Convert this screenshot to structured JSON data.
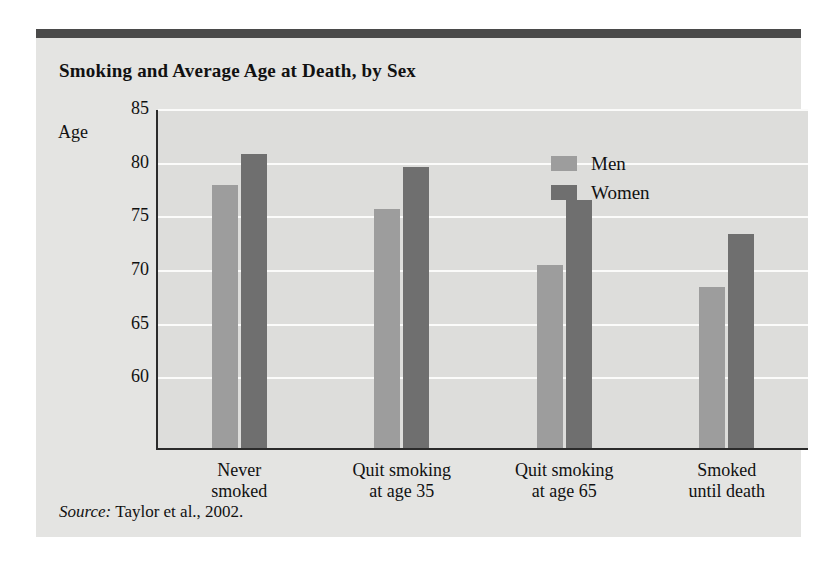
{
  "figure": {
    "title": "Smoking and Average Age at Death, by Sex",
    "axis_label": "Age",
    "source_prefix": "Source:",
    "source_text": " Taylor et al., 2002."
  },
  "colors": {
    "men": "#9d9d9d",
    "women": "#6f6f6f",
    "plot_background": "#dddddb",
    "figure_background": "#e4e4e2",
    "band": "#4a4a4a",
    "axis": "#2b2b2b",
    "gridline": "#fbfbfa"
  },
  "legend": {
    "position": "top-right",
    "entries": [
      {
        "label": "Men",
        "color": "#9d9d9d"
      },
      {
        "label": "Women",
        "color": "#6f6f6f"
      }
    ]
  },
  "chart_data": {
    "type": "bar",
    "title": "Smoking and Average Age at Death, by Sex",
    "xlabel": "",
    "ylabel": "Age",
    "ylim": [
      53.5,
      85
    ],
    "yticks": [
      60,
      65,
      70,
      75,
      80,
      85
    ],
    "ytick_labels": [
      "60",
      "65",
      "70",
      "75",
      "80",
      "85"
    ],
    "grid": true,
    "categories": [
      "Never smoked",
      "Quit smoking at age 35",
      "Quit smoking at age 65",
      "Smoked until death"
    ],
    "category_labels": [
      [
        "Never",
        "smoked"
      ],
      [
        "Quit smoking",
        "at age 35"
      ],
      [
        "Quit smoking",
        "at age 65"
      ],
      [
        "Smoked",
        "until death"
      ]
    ],
    "series": [
      {
        "name": "Men",
        "color": "#9d9d9d",
        "values": [
          78.0,
          75.8,
          70.6,
          68.5
        ]
      },
      {
        "name": "Women",
        "color": "#6f6f6f",
        "values": [
          80.9,
          79.7,
          76.6,
          73.4
        ]
      }
    ],
    "annotations": [
      "Source: Taylor et al., 2002."
    ]
  }
}
